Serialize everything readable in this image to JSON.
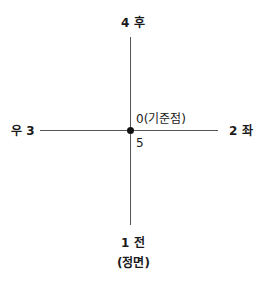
{
  "diagram": {
    "type": "direction-axis",
    "labels": {
      "top": "4 후",
      "left": "우 3",
      "right": "2 좌",
      "bottom": "1 전",
      "bottom_sub": "(정면)",
      "origin": "0(기준점)",
      "center": "5"
    },
    "colors": {
      "line": "#555555",
      "dot": "#111111",
      "text": "#1a1a1a"
    }
  }
}
